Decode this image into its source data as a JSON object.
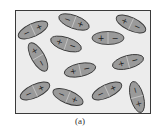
{
  "figure": {
    "caption": "(a)",
    "colors": {
      "frame_stroke": "#3a3a3a",
      "background": "#ececec",
      "dipole_fill": "#9a9a9a",
      "dipole_stroke": "#3a3a3a",
      "sign_color": "#1a1a1a"
    },
    "dipoles": [
      {
        "id": 1,
        "left_sign": "−",
        "right_sign": "+",
        "angle_deg": -25
      },
      {
        "id": 2,
        "left_sign": "−",
        "right_sign": "+",
        "angle_deg": 20
      },
      {
        "id": 3,
        "left_sign": "+",
        "right_sign": "−",
        "angle_deg": 25
      },
      {
        "id": 4,
        "left_sign": "+",
        "right_sign": "−",
        "angle_deg": 0
      },
      {
        "id": 5,
        "left_sign": "+",
        "right_sign": "−",
        "angle_deg": 18
      },
      {
        "id": 6,
        "left_sign": "+",
        "right_sign": "−",
        "angle_deg": 60
      },
      {
        "id": 7,
        "left_sign": "+",
        "right_sign": "−",
        "angle_deg": -12
      },
      {
        "id": 8,
        "left_sign": "+",
        "right_sign": "−",
        "angle_deg": -15
      },
      {
        "id": 9,
        "left_sign": "−",
        "right_sign": "+",
        "angle_deg": -25
      },
      {
        "id": 10,
        "left_sign": "−",
        "right_sign": "+",
        "angle_deg": 22
      },
      {
        "id": 11,
        "left_sign": "−",
        "right_sign": "+",
        "angle_deg": -25
      },
      {
        "id": 12,
        "left_sign": "−",
        "right_sign": "+",
        "angle_deg": 75
      }
    ]
  }
}
